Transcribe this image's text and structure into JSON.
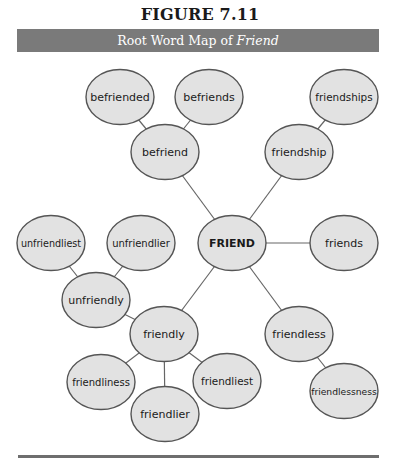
{
  "figure": {
    "number_label": "FIGURE 7.11",
    "caption_prefix": "Root Word Map of ",
    "caption_emphasis": "Friend"
  },
  "style": {
    "node_fill": "#e2e2e2",
    "node_stroke": "#555555",
    "edge_stroke": "#666666",
    "caption_bar": "#7a7a7a"
  },
  "diagram": {
    "root": "FRIEND",
    "nodes": [
      {
        "id": "friend",
        "label": "FRIEND",
        "cx": 232,
        "cy": 243,
        "bold": true
      },
      {
        "id": "befriend",
        "label": "befriend",
        "cx": 165,
        "cy": 152
      },
      {
        "id": "befriended",
        "label": "befriended",
        "cx": 120,
        "cy": 97
      },
      {
        "id": "befriends",
        "label": "befriends",
        "cx": 209,
        "cy": 97
      },
      {
        "id": "friendship",
        "label": "friendship",
        "cx": 299,
        "cy": 152
      },
      {
        "id": "friendships",
        "label": "friendships",
        "cx": 344,
        "cy": 97
      },
      {
        "id": "friends",
        "label": "friends",
        "cx": 344,
        "cy": 243
      },
      {
        "id": "unfriendliest",
        "label": "unfriendliest",
        "cx": 51,
        "cy": 243
      },
      {
        "id": "unfriendlier",
        "label": "unfriendlier",
        "cx": 141,
        "cy": 243
      },
      {
        "id": "unfriendly",
        "label": "unfriendly",
        "cx": 96,
        "cy": 300
      },
      {
        "id": "friendly",
        "label": "friendly",
        "cx": 164,
        "cy": 334
      },
      {
        "id": "friendliness",
        "label": "friendliness",
        "cx": 101,
        "cy": 382
      },
      {
        "id": "friendlier",
        "label": "friendlier",
        "cx": 165,
        "cy": 414
      },
      {
        "id": "friendliest",
        "label": "friendliest",
        "cx": 227,
        "cy": 381
      },
      {
        "id": "friendless",
        "label": "friendless",
        "cx": 299,
        "cy": 334
      },
      {
        "id": "friendlessness",
        "label": "friendlessness",
        "cx": 344,
        "cy": 391
      }
    ],
    "edges": [
      [
        "friend",
        "befriend"
      ],
      [
        "befriend",
        "befriended"
      ],
      [
        "befriend",
        "befriends"
      ],
      [
        "friend",
        "friendship"
      ],
      [
        "friendship",
        "friendships"
      ],
      [
        "friend",
        "friends"
      ],
      [
        "friend",
        "friendly"
      ],
      [
        "friendly",
        "unfriendly"
      ],
      [
        "unfriendly",
        "unfriendliest"
      ],
      [
        "unfriendly",
        "unfriendlier"
      ],
      [
        "friendly",
        "friendliness"
      ],
      [
        "friendly",
        "friendlier"
      ],
      [
        "friendly",
        "friendliest"
      ],
      [
        "friend",
        "friendless"
      ],
      [
        "friendless",
        "friendlessness"
      ]
    ]
  }
}
